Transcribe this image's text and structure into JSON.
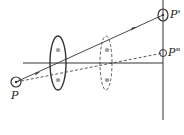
{
  "diagram": {
    "type": "optics-lens-imaging",
    "labels": {
      "object": "P",
      "image_primary": "P'",
      "image_secondary": "P\""
    },
    "lens_marks": [
      "⊗",
      "⊗"
    ],
    "colors": {
      "stroke": "#333333",
      "background": "#ffffff"
    }
  }
}
